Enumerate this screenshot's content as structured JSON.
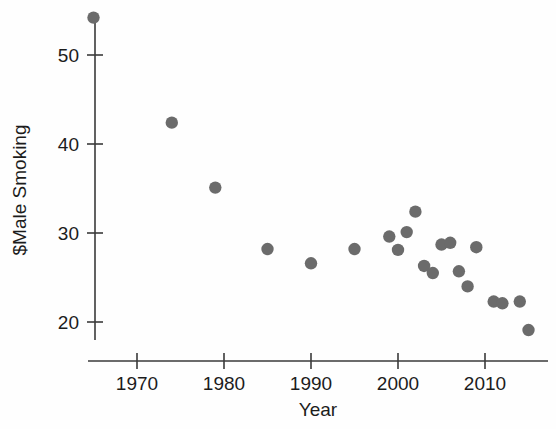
{
  "chart_data": {
    "type": "scatter",
    "title": "",
    "xlabel": "Year",
    "ylabel": "$Male Smoking",
    "xlim": [
      1962,
      1918
    ],
    "ylim": [
      17,
      56
    ],
    "grid": false,
    "legend": null,
    "point_color": "#6b6b6b",
    "axis_color": "#3a3a3a",
    "xticks": [
      1970,
      1980,
      1990,
      2000,
      2010
    ],
    "xtick_labels": [
      "1970",
      "1980",
      "1990",
      "2000",
      "2010"
    ],
    "yticks": [
      20,
      30,
      40,
      50
    ],
    "ytick_labels": [
      "20",
      "30",
      "40",
      "50"
    ],
    "x": [
      1965,
      1974,
      1979,
      1985,
      1990,
      1995,
      1999,
      2000,
      2001,
      2002,
      2003,
      2004,
      2005,
      2006,
      2007,
      2008,
      2009,
      2011,
      2012,
      2014,
      2015
    ],
    "y": [
      54.2,
      42.4,
      35.1,
      28.2,
      26.6,
      28.2,
      29.6,
      28.1,
      30.1,
      32.4,
      26.3,
      25.5,
      28.7,
      28.9,
      25.7,
      24.0,
      28.4,
      22.3,
      22.1,
      22.3,
      19.1
    ],
    "points": [
      {
        "x": 1965,
        "y": 54.2
      },
      {
        "x": 1974,
        "y": 42.4
      },
      {
        "x": 1979,
        "y": 35.1
      },
      {
        "x": 1985,
        "y": 28.2
      },
      {
        "x": 1990,
        "y": 26.6
      },
      {
        "x": 1995,
        "y": 28.2
      },
      {
        "x": 1999,
        "y": 29.6
      },
      {
        "x": 2000,
        "y": 28.1
      },
      {
        "x": 2001,
        "y": 30.1
      },
      {
        "x": 2002,
        "y": 32.4
      },
      {
        "x": 2003,
        "y": 26.3
      },
      {
        "x": 2004,
        "y": 25.5
      },
      {
        "x": 2005,
        "y": 28.7
      },
      {
        "x": 2006,
        "y": 28.9
      },
      {
        "x": 2007,
        "y": 25.7
      },
      {
        "x": 2008,
        "y": 24.0
      },
      {
        "x": 2009,
        "y": 28.4
      },
      {
        "x": 2011,
        "y": 22.3
      },
      {
        "x": 2012,
        "y": 22.1
      },
      {
        "x": 2014,
        "y": 22.3
      },
      {
        "x": 2015,
        "y": 19.1
      }
    ]
  },
  "axes": {
    "x_title": "Year",
    "y_title": "$Male Smoking"
  }
}
